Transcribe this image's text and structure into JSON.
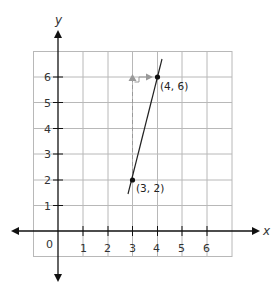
{
  "graph": {
    "axes": {
      "x_label": "x",
      "y_label": "y",
      "origin_label": "0",
      "x_ticks": [
        "1",
        "2",
        "3",
        "4",
        "5",
        "6"
      ],
      "y_ticks": [
        "1",
        "2",
        "3",
        "4",
        "5",
        "6"
      ],
      "grid_range": {
        "x": [
          -1,
          7
        ],
        "y": [
          -1,
          7
        ]
      }
    },
    "line": {
      "points": [
        {
          "x": 3,
          "y": 2,
          "label": "(3, 2)"
        },
        {
          "x": 4,
          "y": 6,
          "label": "(4, 6)"
        }
      ],
      "slope_rise": 4,
      "slope_run": 1
    },
    "colors": {
      "grid": "#b8b8b8",
      "axis": "#111111",
      "line": "#222222",
      "guide": "#999999"
    }
  }
}
